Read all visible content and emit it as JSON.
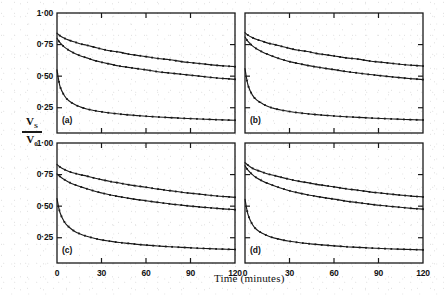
{
  "figure": {
    "axis_labels": {
      "y_numerator": "V",
      "y_numerator_sub": "S",
      "y_denominator": "V",
      "y_denominator_sub": "0",
      "x": "Time (minutes)"
    },
    "y_ticks": [
      "1·00",
      "0·75",
      "0·50",
      "0·25"
    ],
    "y_tick_values": [
      1.0,
      0.75,
      0.5,
      0.25
    ],
    "x_ticks": [
      "0",
      "30",
      "60",
      "90",
      "120"
    ],
    "x_tick_values": [
      0,
      30,
      60,
      90,
      120
    ],
    "panel_labels": [
      "(a)",
      "(b)",
      "(c)",
      "(d)"
    ]
  },
  "chart_data": [
    {
      "type": "line",
      "title": "(a)",
      "xlabel": "Time (minutes)",
      "ylabel": "Vs/V0",
      "xlim": [
        0,
        120
      ],
      "ylim": [
        0.05,
        1.0
      ],
      "grid": false,
      "legend": "none",
      "markers": "small filled dots",
      "series": [
        {
          "name": "upper curve",
          "x": [
            0,
            2,
            5,
            8,
            12,
            16,
            20,
            25,
            30,
            36,
            42,
            48,
            54,
            60,
            68,
            76,
            84,
            92,
            100,
            108,
            114,
            120
          ],
          "values": [
            0.84,
            0.82,
            0.8,
            0.785,
            0.77,
            0.755,
            0.745,
            0.73,
            0.715,
            0.7,
            0.69,
            0.675,
            0.665,
            0.655,
            0.64,
            0.63,
            0.615,
            0.605,
            0.595,
            0.585,
            0.58,
            0.575
          ]
        },
        {
          "name": "middle curve",
          "x": [
            0,
            2,
            5,
            8,
            12,
            16,
            20,
            25,
            30,
            36,
            42,
            48,
            54,
            60,
            68,
            76,
            84,
            92,
            100,
            108,
            114,
            120
          ],
          "values": [
            0.8,
            0.765,
            0.73,
            0.705,
            0.68,
            0.66,
            0.645,
            0.625,
            0.61,
            0.595,
            0.58,
            0.57,
            0.56,
            0.55,
            0.535,
            0.525,
            0.515,
            0.505,
            0.495,
            0.485,
            0.48,
            0.475
          ]
        },
        {
          "name": "lower curve",
          "x": [
            0,
            2,
            5,
            8,
            12,
            16,
            20,
            25,
            30,
            36,
            42,
            48,
            54,
            60,
            68,
            76,
            84,
            92,
            100,
            108,
            114,
            120
          ],
          "values": [
            0.55,
            0.42,
            0.345,
            0.305,
            0.275,
            0.255,
            0.24,
            0.228,
            0.218,
            0.208,
            0.2,
            0.194,
            0.188,
            0.183,
            0.177,
            0.172,
            0.167,
            0.163,
            0.159,
            0.155,
            0.153,
            0.151
          ]
        }
      ]
    },
    {
      "type": "line",
      "title": "(b)",
      "xlabel": "Time (minutes)",
      "ylabel": "Vs/V0",
      "xlim": [
        0,
        120
      ],
      "ylim": [
        0.05,
        1.0
      ],
      "grid": false,
      "legend": "none",
      "markers": "small filled dots",
      "series": [
        {
          "name": "upper curve",
          "x": [
            0,
            2,
            5,
            8,
            12,
            16,
            20,
            25,
            30,
            36,
            42,
            48,
            54,
            60,
            68,
            76,
            84,
            92,
            100,
            108,
            114,
            120
          ],
          "values": [
            0.845,
            0.825,
            0.805,
            0.79,
            0.775,
            0.76,
            0.75,
            0.735,
            0.72,
            0.705,
            0.695,
            0.68,
            0.67,
            0.66,
            0.645,
            0.635,
            0.62,
            0.61,
            0.6,
            0.59,
            0.585,
            0.58
          ]
        },
        {
          "name": "middle curve",
          "x": [
            0,
            2,
            5,
            8,
            12,
            16,
            20,
            25,
            30,
            36,
            42,
            48,
            54,
            60,
            68,
            76,
            84,
            92,
            100,
            108,
            114,
            120
          ],
          "values": [
            0.81,
            0.775,
            0.74,
            0.715,
            0.69,
            0.67,
            0.652,
            0.632,
            0.615,
            0.6,
            0.585,
            0.573,
            0.562,
            0.552,
            0.537,
            0.525,
            0.513,
            0.503,
            0.493,
            0.484,
            0.478,
            0.473
          ]
        },
        {
          "name": "lower curve",
          "x": [
            0,
            2,
            5,
            8,
            12,
            16,
            20,
            25,
            30,
            36,
            42,
            48,
            54,
            60,
            68,
            76,
            84,
            92,
            100,
            108,
            114,
            120
          ],
          "values": [
            0.56,
            0.43,
            0.35,
            0.31,
            0.28,
            0.258,
            0.243,
            0.23,
            0.22,
            0.21,
            0.202,
            0.196,
            0.19,
            0.185,
            0.179,
            0.174,
            0.169,
            0.165,
            0.161,
            0.157,
            0.155,
            0.153
          ]
        }
      ]
    },
    {
      "type": "line",
      "title": "(c)",
      "xlabel": "Time (minutes)",
      "ylabel": "Vs/V0",
      "xlim": [
        0,
        120
      ],
      "ylim": [
        0.05,
        1.0
      ],
      "grid": false,
      "legend": "none",
      "markers": "small filled dots",
      "series": [
        {
          "name": "upper curve",
          "x": [
            0,
            2,
            5,
            8,
            12,
            16,
            20,
            25,
            30,
            36,
            42,
            48,
            54,
            60,
            68,
            76,
            84,
            92,
            100,
            108,
            114,
            120
          ],
          "values": [
            0.83,
            0.81,
            0.79,
            0.775,
            0.76,
            0.748,
            0.738,
            0.723,
            0.71,
            0.695,
            0.683,
            0.67,
            0.66,
            0.65,
            0.635,
            0.623,
            0.61,
            0.6,
            0.59,
            0.58,
            0.575,
            0.57
          ]
        },
        {
          "name": "middle curve",
          "x": [
            0,
            2,
            5,
            8,
            12,
            16,
            20,
            25,
            30,
            36,
            42,
            48,
            54,
            60,
            68,
            76,
            84,
            92,
            100,
            108,
            114,
            120
          ],
          "values": [
            0.755,
            0.735,
            0.71,
            0.69,
            0.67,
            0.653,
            0.638,
            0.62,
            0.605,
            0.588,
            0.575,
            0.563,
            0.552,
            0.543,
            0.53,
            0.518,
            0.508,
            0.498,
            0.49,
            0.482,
            0.477,
            0.472
          ]
        },
        {
          "name": "lower curve",
          "x": [
            0,
            2,
            5,
            8,
            12,
            16,
            20,
            25,
            30,
            36,
            42,
            48,
            54,
            60,
            68,
            76,
            84,
            92,
            100,
            108,
            114,
            120
          ],
          "values": [
            0.56,
            0.45,
            0.375,
            0.335,
            0.3,
            0.278,
            0.262,
            0.246,
            0.233,
            0.222,
            0.212,
            0.205,
            0.198,
            0.192,
            0.185,
            0.179,
            0.174,
            0.169,
            0.165,
            0.161,
            0.159,
            0.157
          ]
        }
      ]
    },
    {
      "type": "line",
      "title": "(d)",
      "xlabel": "Time (minutes)",
      "ylabel": "Vs/V0",
      "xlim": [
        0,
        120
      ],
      "ylim": [
        0.05,
        1.0
      ],
      "grid": false,
      "legend": "none",
      "markers": "small filled dots",
      "series": [
        {
          "name": "upper curve",
          "x": [
            0,
            2,
            5,
            8,
            12,
            16,
            20,
            25,
            30,
            36,
            42,
            48,
            54,
            60,
            68,
            76,
            84,
            92,
            100,
            108,
            114,
            120
          ],
          "values": [
            0.845,
            0.825,
            0.8,
            0.785,
            0.768,
            0.753,
            0.742,
            0.727,
            0.713,
            0.698,
            0.686,
            0.673,
            0.663,
            0.653,
            0.638,
            0.626,
            0.613,
            0.603,
            0.593,
            0.584,
            0.578,
            0.573
          ]
        },
        {
          "name": "middle curve",
          "x": [
            0,
            2,
            5,
            8,
            12,
            16,
            20,
            25,
            30,
            36,
            42,
            48,
            54,
            60,
            68,
            76,
            84,
            92,
            100,
            108,
            114,
            120
          ],
          "values": [
            0.82,
            0.785,
            0.75,
            0.723,
            0.698,
            0.677,
            0.66,
            0.64,
            0.622,
            0.605,
            0.59,
            0.578,
            0.566,
            0.556,
            0.54,
            0.528,
            0.516,
            0.505,
            0.496,
            0.487,
            0.481,
            0.476
          ]
        },
        {
          "name": "lower curve",
          "x": [
            0,
            2,
            5,
            8,
            12,
            16,
            20,
            25,
            30,
            36,
            42,
            48,
            54,
            60,
            68,
            76,
            84,
            92,
            100,
            108,
            114,
            120
          ],
          "values": [
            0.555,
            0.435,
            0.355,
            0.313,
            0.283,
            0.262,
            0.247,
            0.233,
            0.222,
            0.212,
            0.204,
            0.197,
            0.191,
            0.186,
            0.179,
            0.174,
            0.169,
            0.165,
            0.161,
            0.158,
            0.156,
            0.154
          ]
        }
      ]
    }
  ]
}
